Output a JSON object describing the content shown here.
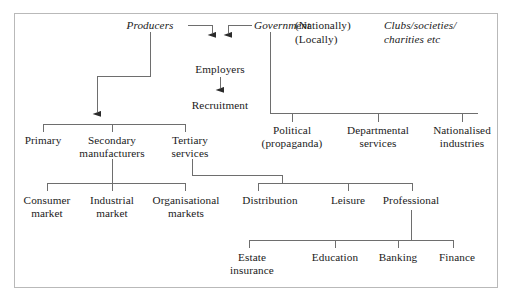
{
  "diagram": {
    "type": "tree-diagram",
    "frame_color": "#b9b9b9",
    "line_color": "#6e6e6e",
    "text_color": "#1a1a1a",
    "background": "#ffffff",
    "nodes": {
      "producers": "Producers",
      "government": "Government",
      "nationally": "(Nationally)",
      "locally": "(Locally)",
      "clubs_line1": "Clubs/societies/",
      "clubs_line2": "charities etc",
      "employers": "Employers",
      "recruitment": "Recruitment",
      "primary": "Primary",
      "secondary_line1": "Secondary",
      "secondary_line2": "manufacturers",
      "tertiary_line1": "Tertiary",
      "tertiary_line2": "services",
      "political_line1": "Political",
      "political_line2": "(propaganda)",
      "departmental_line1": "Departmental",
      "departmental_line2": "services",
      "nationalised_line1": "Nationalised",
      "nationalised_line2": "industries",
      "consumer_line1": "Consumer",
      "consumer_line2": "market",
      "industrial_line1": "Industrial",
      "industrial_line2": "market",
      "organisational_line1": "Organisational",
      "organisational_line2": "markets",
      "distribution": "Distribution",
      "leisure": "Leisure",
      "professional": "Professional",
      "estate_line1": "Estate",
      "estate_line2": "insurance",
      "education": "Education",
      "banking": "Banking",
      "finance": "Finance"
    },
    "edges": [
      {
        "from": "producers",
        "to": "employers",
        "kind": "arrow"
      },
      {
        "from": "government",
        "to": "employers",
        "kind": "arrow"
      },
      {
        "from": "employers",
        "to": "recruitment",
        "kind": "arrow"
      },
      {
        "from": "producers",
        "to": "primary-secondary-tertiary",
        "kind": "arrow"
      },
      {
        "from": "government",
        "to": "political-departmental-nationalised",
        "kind": "bracket"
      },
      {
        "from": "secondary",
        "to": "consumer-industrial-organisational",
        "kind": "bracket"
      },
      {
        "from": "tertiary",
        "to": "distribution-leisure-professional",
        "kind": "bracket"
      },
      {
        "from": "professional",
        "to": "estate-education-banking-finance",
        "kind": "bracket"
      }
    ]
  }
}
